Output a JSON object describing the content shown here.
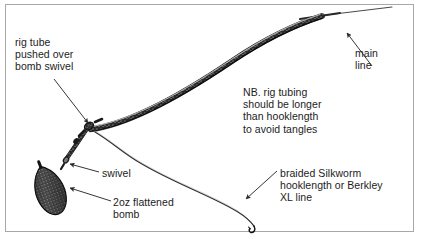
{
  "figure": {
    "kind": "fishing-rig-diagram",
    "background_color": "#ffffff",
    "border_color": "#a8a8a8",
    "ink_color": "#1c1c1c"
  },
  "labels": {
    "rig_tube": "rig tube\npushed over\nbomb swivel",
    "note": "NB. rig tubing\nshould be longer\nthan hooklength\nto avoid tangles",
    "main_line": "main\nline",
    "swivel": "swivel",
    "bomb": "2oz flattened\nbomb",
    "braided": "braided Silkworm\nhooklength or Berkley\nXL line"
  },
  "parts": [
    {
      "name": "rig-tubing",
      "description": "thick textured tube curving from swivel up to the right"
    },
    {
      "name": "main-line",
      "description": "thin line continuing beyond the rig tubing to upper right"
    },
    {
      "name": "bomb-swivel",
      "description": "swivel at the junction of tubing, bomb link and hooklength"
    },
    {
      "name": "flattened-bomb",
      "description": "2oz pear shaped stippled lead weight"
    },
    {
      "name": "hooklength",
      "description": "thin braided line curving down to the right ending at the hook"
    },
    {
      "name": "hook",
      "description": "small hook at the end of the hooklength"
    }
  ],
  "annotation_arrows": [
    {
      "name": "rig-tube-arrow",
      "from": [
        54,
        79
      ],
      "to": [
        88,
        123
      ]
    },
    {
      "name": "main-line-arrow",
      "from": [
        372,
        66
      ],
      "to": [
        346,
        33
      ]
    },
    {
      "name": "swivel-arrow",
      "from": [
        99,
        172
      ],
      "to": [
        68,
        163
      ]
    },
    {
      "name": "bomb-arrow",
      "from": [
        110,
        201
      ],
      "to": [
        68,
        188
      ]
    },
    {
      "name": "braided-arrow",
      "from": [
        277,
        171
      ],
      "to": [
        245,
        199
      ]
    }
  ]
}
